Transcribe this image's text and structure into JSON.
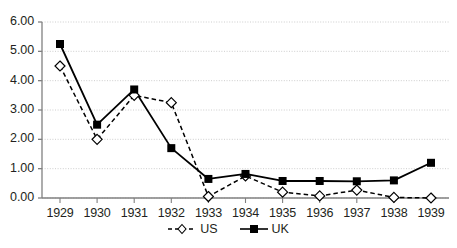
{
  "chart_data": {
    "type": "line",
    "title": "",
    "xlabel": "",
    "ylabel": "",
    "categories": [
      "1929",
      "1930",
      "1931",
      "1932",
      "1933",
      "1934",
      "1935",
      "1936",
      "1937",
      "1938",
      "1939"
    ],
    "series": [
      {
        "name": "US",
        "style": "dashed",
        "marker": "open-diamond",
        "color": "#000000",
        "values": [
          4.5,
          2.0,
          3.5,
          3.25,
          0.05,
          0.75,
          0.2,
          0.07,
          0.27,
          0.02,
          0.0
        ]
      },
      {
        "name": "UK",
        "style": "solid",
        "marker": "filled-square",
        "color": "#000000",
        "values": [
          5.25,
          2.5,
          3.7,
          1.7,
          0.65,
          0.82,
          0.58,
          0.58,
          0.57,
          0.6,
          1.2
        ]
      }
    ],
    "ylim": [
      0,
      6
    ],
    "yticks": [
      0,
      1,
      2,
      3,
      4,
      5,
      6
    ],
    "ytick_labels": [
      "0.00",
      "1.00",
      "2.00",
      "3.00",
      "4.00",
      "5.00",
      "6.00"
    ],
    "grid": true,
    "grid_color": "#c8c8c8",
    "axis_color": "#808080",
    "legend_position": "bottom-center"
  },
  "legend": {
    "entries": [
      {
        "label": "US"
      },
      {
        "label": "UK"
      }
    ]
  }
}
